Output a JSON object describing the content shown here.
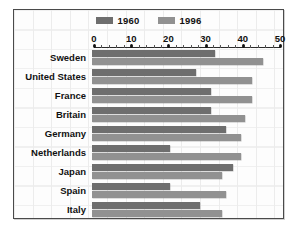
{
  "chart_data": {
    "type": "bar",
    "orientation": "horizontal",
    "title": "",
    "xlabel": "",
    "ylabel": "",
    "xlim": [
      0,
      50
    ],
    "grid": true,
    "legend_position": "top-center",
    "axis_ticks": [
      0,
      10,
      20,
      30,
      40,
      50
    ],
    "categories": [
      "Sweden",
      "United States",
      "France",
      "Britain",
      "Germany",
      "Netherlands",
      "Japan",
      "Spain",
      "Italy"
    ],
    "series": [
      {
        "name": "1960",
        "color": "#6e6e6e",
        "values": [
          33,
          28,
          32,
          32,
          36,
          21,
          38,
          21,
          29
        ]
      },
      {
        "name": "1996",
        "color": "#919191",
        "values": [
          46,
          43,
          43,
          41,
          40,
          40,
          35,
          36,
          35
        ]
      }
    ]
  },
  "legend": {
    "entries": [
      {
        "label": "1960"
      },
      {
        "label": "1996"
      }
    ]
  },
  "colors": {
    "series_1960": "#6e6e6e",
    "series_1996": "#919191",
    "frame_border": "#4a4a4a",
    "grid": "#ececec",
    "text": "#111111",
    "background": "#fdfdfd"
  }
}
